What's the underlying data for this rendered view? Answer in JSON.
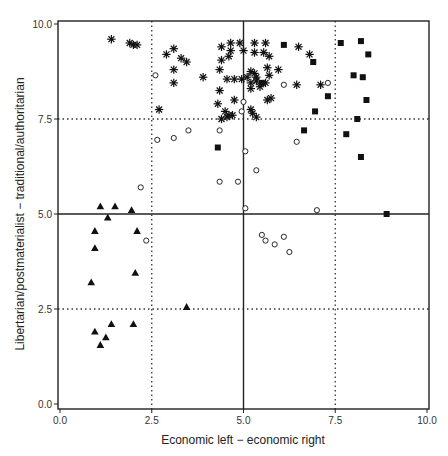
{
  "chart_data": {
    "type": "scatter",
    "title": "",
    "xlabel": "Economic left − economic right",
    "ylabel": "Libertarian/postmaterialist − traditional/authoritarian",
    "xlim": [
      0,
      10
    ],
    "ylim": [
      0,
      10
    ],
    "xticks": [
      "0.0",
      "2.5",
      "5.0",
      "7.5",
      "10.0"
    ],
    "yticks": [
      "0.0",
      "2.5",
      "5.0",
      "7.5",
      "10.0"
    ],
    "grid": {
      "solid": {
        "x": [
          5.0
        ],
        "y": [
          5.0
        ]
      },
      "dotted": {
        "x": [
          2.5,
          7.5
        ],
        "y": [
          2.5,
          7.5
        ]
      }
    },
    "legend": "none",
    "series": [
      {
        "name": "asterisk",
        "marker": "asterisk",
        "color": "#111111",
        "points": [
          [
            1.4,
            9.6
          ],
          [
            1.9,
            9.5
          ],
          [
            2.0,
            9.45
          ],
          [
            2.1,
            9.45
          ],
          [
            2.9,
            9.2
          ],
          [
            3.1,
            9.35
          ],
          [
            3.3,
            9.1
          ],
          [
            3.45,
            9.0
          ],
          [
            3.1,
            8.8
          ],
          [
            3.1,
            8.45
          ],
          [
            3.9,
            8.6
          ],
          [
            4.4,
            9.4
          ],
          [
            4.4,
            9.05
          ],
          [
            4.6,
            9.15
          ],
          [
            4.35,
            8.8
          ],
          [
            4.35,
            8.25
          ],
          [
            4.3,
            7.9
          ],
          [
            4.4,
            7.5
          ],
          [
            2.7,
            7.75
          ],
          [
            4.65,
            9.5
          ],
          [
            4.65,
            9.3
          ],
          [
            4.55,
            8.55
          ],
          [
            4.75,
            8.55
          ],
          [
            4.75,
            8.0
          ],
          [
            4.5,
            7.7
          ],
          [
            4.55,
            7.55
          ],
          [
            4.6,
            7.6
          ],
          [
            4.7,
            7.6
          ],
          [
            4.9,
            9.5
          ],
          [
            5.0,
            9.3
          ],
          [
            4.95,
            8.55
          ],
          [
            5.1,
            8.6
          ],
          [
            5.2,
            8.45
          ],
          [
            5.3,
            9.5
          ],
          [
            5.3,
            9.25
          ],
          [
            5.35,
            8.6
          ],
          [
            5.35,
            8.5
          ],
          [
            5.3,
            8.7
          ],
          [
            5.45,
            8.35
          ],
          [
            5.2,
            8.3
          ],
          [
            5.2,
            7.75
          ],
          [
            5.6,
            8.45
          ],
          [
            5.25,
            7.65
          ],
          [
            5.6,
            9.5
          ],
          [
            5.55,
            9.25
          ],
          [
            5.7,
            9.15
          ],
          [
            5.65,
            8.85
          ],
          [
            5.7,
            8.65
          ],
          [
            5.95,
            8.8
          ],
          [
            5.65,
            8.0
          ],
          [
            5.75,
            8.05
          ],
          [
            6.5,
            9.4
          ],
          [
            6.8,
            9.2
          ],
          [
            7.1,
            8.4
          ],
          [
            5.35,
            7.55
          ],
          [
            5.2,
            8.75
          ],
          [
            6.45,
            8.4
          ]
        ]
      },
      {
        "name": "open circle",
        "marker": "circle-open",
        "color": "#111111",
        "points": [
          [
            2.6,
            8.65
          ],
          [
            2.65,
            6.95
          ],
          [
            3.1,
            7.0
          ],
          [
            3.5,
            7.2
          ],
          [
            2.2,
            5.7
          ],
          [
            2.35,
            4.3
          ],
          [
            4.35,
            5.85
          ],
          [
            4.85,
            5.85
          ],
          [
            4.35,
            7.2
          ],
          [
            5.05,
            6.65
          ],
          [
            5.35,
            6.15
          ],
          [
            5.0,
            7.95
          ],
          [
            4.95,
            7.7
          ],
          [
            6.1,
            8.4
          ],
          [
            6.45,
            6.9
          ],
          [
            5.05,
            5.15
          ],
          [
            7.0,
            5.1
          ],
          [
            7.3,
            8.45
          ],
          [
            5.5,
            4.45
          ],
          [
            5.6,
            4.3
          ],
          [
            5.85,
            4.2
          ],
          [
            6.1,
            4.4
          ],
          [
            6.25,
            4.0
          ]
        ]
      },
      {
        "name": "filled square",
        "marker": "square-filled",
        "color": "#111111",
        "points": [
          [
            6.1,
            9.45
          ],
          [
            7.65,
            9.5
          ],
          [
            8.2,
            9.55
          ],
          [
            8.4,
            9.2
          ],
          [
            6.9,
            9.0
          ],
          [
            8.0,
            8.65
          ],
          [
            8.25,
            8.6
          ],
          [
            7.3,
            8.1
          ],
          [
            5.5,
            8.45
          ],
          [
            8.35,
            8.0
          ],
          [
            6.95,
            7.7
          ],
          [
            8.1,
            7.5
          ],
          [
            4.3,
            6.75
          ],
          [
            6.65,
            7.2
          ],
          [
            7.8,
            7.1
          ],
          [
            8.2,
            6.5
          ],
          [
            8.9,
            5.0
          ]
        ]
      },
      {
        "name": "filled triangle",
        "marker": "triangle-filled",
        "color": "#111111",
        "points": [
          [
            1.1,
            5.2
          ],
          [
            1.5,
            5.2
          ],
          [
            1.95,
            5.1
          ],
          [
            1.3,
            4.9
          ],
          [
            0.95,
            4.55
          ],
          [
            2.1,
            4.55
          ],
          [
            0.95,
            4.1
          ],
          [
            2.05,
            3.45
          ],
          [
            0.85,
            3.2
          ],
          [
            3.45,
            2.55
          ],
          [
            1.4,
            2.1
          ],
          [
            2.0,
            2.1
          ],
          [
            0.95,
            1.9
          ],
          [
            1.25,
            1.75
          ],
          [
            1.1,
            1.55
          ]
        ]
      }
    ]
  }
}
